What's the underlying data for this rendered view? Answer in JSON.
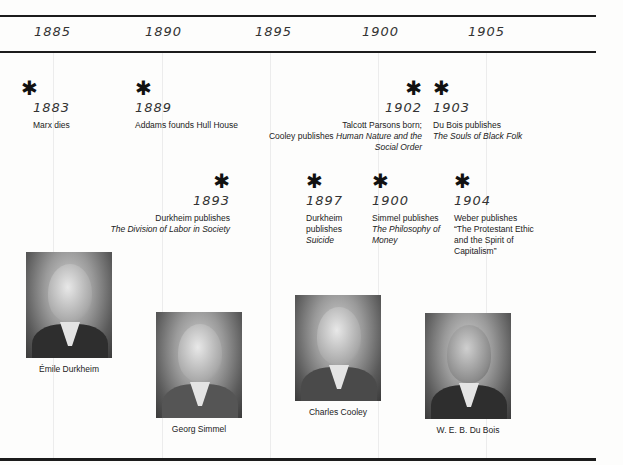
{
  "axis": {
    "years": [
      {
        "label": "1885",
        "x": 26
      },
      {
        "label": "1890",
        "x": 145
      },
      {
        "label": "1895",
        "x": 255
      },
      {
        "label": "1900",
        "x": 362
      },
      {
        "label": "1905",
        "x": 468
      }
    ]
  },
  "events": [
    {
      "year": "1883",
      "star": "✱",
      "desc": "Marx dies",
      "title": ""
    },
    {
      "year": "1889",
      "star": "✱",
      "desc": "Addams founds Hull House",
      "title": ""
    },
    {
      "year": "1893",
      "star": "✱",
      "desc": "Durkheim publishes",
      "title": "The Division of Labor in Society"
    },
    {
      "year": "1897",
      "star": "✱",
      "desc": "Durkheim publishes",
      "title": "Suicide"
    },
    {
      "year": "1900",
      "star": "✱",
      "desc": "Simmel publishes",
      "title": "The Philosophy of Money"
    },
    {
      "year": "1902",
      "star": "✱",
      "desc_line1": "Talcott Parsons born;",
      "desc": "Cooley publishes",
      "title": "Human Nature and the Social Order"
    },
    {
      "year": "1903",
      "star": "✱",
      "desc": "Du Bois publishes",
      "title": "The Souls of Black Folk"
    },
    {
      "year": "1904",
      "star": "✱",
      "desc": "Weber publishes “The Protestant Ethic and the Spirit of Capitalism”",
      "title": ""
    }
  ],
  "portraits": [
    {
      "name": "Émile Durkheim"
    },
    {
      "name": "Georg Simmel"
    },
    {
      "name": "Charles Cooley"
    },
    {
      "name": "W. E. B. Du Bois"
    }
  ]
}
